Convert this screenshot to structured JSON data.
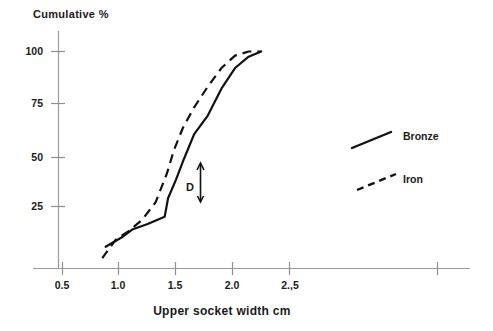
{
  "chart_data": {
    "type": "line",
    "title": "",
    "xlabel": "Upper socket width cm",
    "ylabel": "Cumulative %",
    "xlim": [
      0.25,
      3.9
    ],
    "ylim": [
      0,
      108
    ],
    "grid": false,
    "legend_position": "right",
    "xticks": [
      {
        "value": 0.5,
        "label": "0.5"
      },
      {
        "value": 1.0,
        "label": "1.0"
      },
      {
        "value": 1.5,
        "label": "1.5"
      },
      {
        "value": 2.0,
        "label": "2.0"
      },
      {
        "value": 2.5,
        "label": "2.,5"
      },
      {
        "value": 3.8,
        "label": ""
      }
    ],
    "yticks": [
      {
        "value": 25,
        "label": "25"
      },
      {
        "value": 50,
        "label": "50"
      },
      {
        "value": 75,
        "label": "75"
      },
      {
        "value": 100,
        "label": "100"
      }
    ],
    "series": [
      {
        "name": "Bronze",
        "style": "solid",
        "x": [
          0.88,
          1.02,
          1.12,
          1.25,
          1.4,
          1.43,
          1.5,
          1.57,
          1.66,
          1.78,
          1.9,
          2.02,
          2.14,
          2.25
        ],
        "y": [
          5.5,
          10.0,
          14.0,
          16.5,
          20.0,
          29.0,
          38.0,
          48.0,
          60.0,
          69.0,
          82.0,
          92.0,
          97.5,
          100.0
        ]
      },
      {
        "name": "Iron",
        "style": "dashed",
        "x": [
          0.85,
          0.97,
          1.08,
          1.2,
          1.32,
          1.42,
          1.48,
          1.56,
          1.66,
          1.78,
          1.9,
          2.02,
          2.14,
          2.25
        ],
        "y": [
          0.0,
          9.0,
          13.0,
          18.5,
          27.0,
          41.0,
          52.0,
          63.0,
          73.0,
          83.0,
          92.0,
          98.0,
          100.0,
          100.0
        ]
      }
    ],
    "annotations": [
      {
        "label": "D",
        "kind": "vertical-double-arrow",
        "x": 1.44,
        "y_from": 28.0,
        "y_to": 46.0
      }
    ],
    "legend": [
      {
        "label": "Bronze",
        "style": "solid"
      },
      {
        "label": "Iron",
        "style": "dashed"
      }
    ]
  }
}
